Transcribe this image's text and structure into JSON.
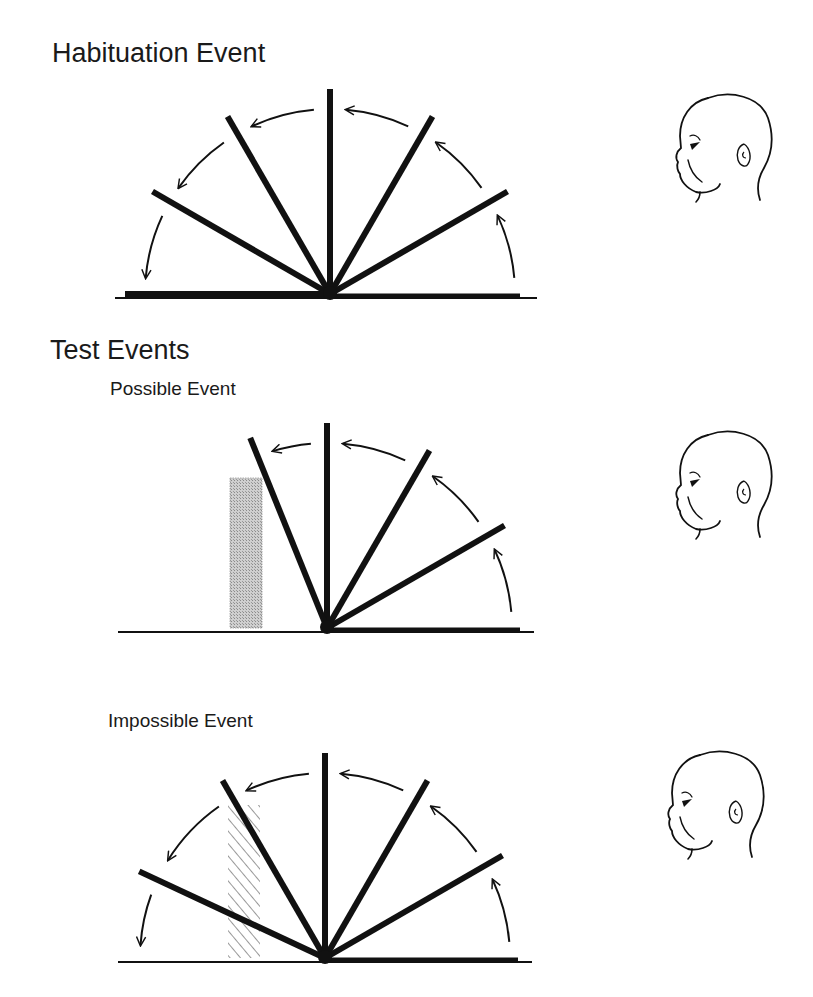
{
  "titles": {
    "habituation": "Habituation Event",
    "test": "Test Events",
    "possible": "Possible Event",
    "impossible": "Impossible Event"
  },
  "colors": {
    "ink": "#111111",
    "box_fill": "#bdbdbd",
    "hatch": "#333333"
  },
  "panels": [
    {
      "id": "habituation",
      "pivot": [
        330,
        294
      ],
      "radius": 205,
      "screen_angles_deg": [
        0,
        30,
        60,
        90,
        120,
        150,
        180
      ],
      "arrow_radius": 185,
      "arrow_segments": [
        [
          5,
          25
        ],
        [
          35,
          55
        ],
        [
          65,
          85
        ],
        [
          95,
          115
        ],
        [
          125,
          145
        ],
        [
          155,
          175
        ]
      ],
      "baseline": {
        "thin": [
          115,
          537
        ],
        "thick": [
          138,
          520
        ]
      },
      "box": null,
      "face": {
        "x": 660,
        "y": 88,
        "scale": 1.0
      }
    },
    {
      "id": "possible",
      "pivot": [
        327,
        628
      ],
      "radius": 205,
      "screen_angles_deg": [
        0,
        30,
        60,
        90,
        112
      ],
      "arrow_radius": 185,
      "arrow_segments": [
        [
          5,
          25
        ],
        [
          35,
          55
        ],
        [
          65,
          85
        ],
        [
          95,
          107
        ]
      ],
      "baseline": {
        "thin": [
          118,
          534
        ],
        "thick": [
          327,
          520
        ]
      },
      "box": {
        "x": 230,
        "y": 478,
        "w": 32,
        "h": 150,
        "style": "solid"
      },
      "face": {
        "x": 660,
        "y": 425,
        "scale": 1.0
      }
    },
    {
      "id": "impossible",
      "pivot": [
        325,
        958
      ],
      "radius": 205,
      "screen_angles_deg": [
        0,
        30,
        60,
        90,
        120,
        155
      ],
      "arrow_radius": 185,
      "arrow_segments": [
        [
          5,
          25
        ],
        [
          35,
          55
        ],
        [
          65,
          85
        ],
        [
          95,
          115
        ],
        [
          125,
          148
        ],
        [
          160,
          176
        ]
      ],
      "baseline": {
        "thin": [
          118,
          532
        ],
        "thick": [
          325,
          518
        ]
      },
      "box": {
        "x": 228,
        "y": 805,
        "w": 32,
        "h": 153,
        "style": "hatched"
      },
      "face": {
        "x": 652,
        "y": 745,
        "scale": 1.0
      }
    }
  ]
}
